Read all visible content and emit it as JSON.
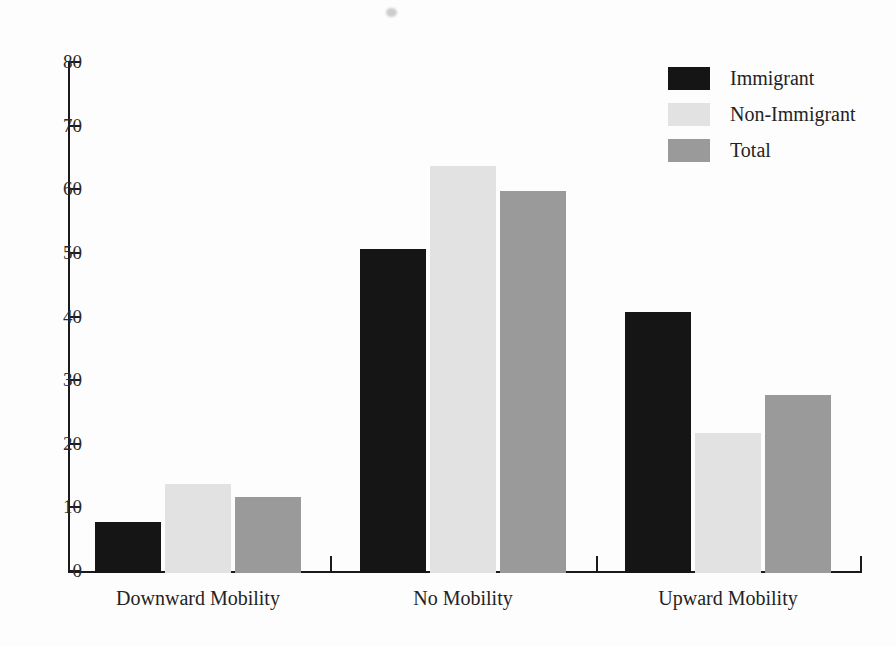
{
  "chart_data": {
    "type": "bar",
    "title": "",
    "subtitle": "",
    "xlabel": "",
    "ylabel": "",
    "categories": [
      "Downward Mobility",
      "No Mobility",
      "Upward Mobility"
    ],
    "series": [
      {
        "name": "Immigrant",
        "color": "#151515",
        "values": [
          8,
          51,
          41
        ]
      },
      {
        "name": "Non-Immigrant",
        "color": "#e2e2e2",
        "values": [
          14,
          64,
          22
        ]
      },
      {
        "name": "Total",
        "color": "#9a9a9a",
        "values": [
          12,
          60,
          28
        ]
      }
    ],
    "ylim": [
      0,
      80
    ],
    "ytick_labels": [
      "0",
      "10",
      "20",
      "30",
      "40",
      "50",
      "60",
      "70",
      "80"
    ],
    "ytick_values": [
      0,
      10,
      20,
      30,
      40,
      50,
      60,
      70,
      80
    ],
    "grid": false,
    "legend_position": "top-right",
    "background_color": "#fdfdfd",
    "axis_color": "#1a1a1a"
  },
  "legend": {
    "items": [
      {
        "label": "Immigrant",
        "swatch": "immigrant"
      },
      {
        "label": "Non-Immigrant",
        "swatch": "nonimmigrant"
      },
      {
        "label": "Total",
        "swatch": "total"
      }
    ]
  },
  "artifact": {
    "name": "scan-smudge"
  }
}
